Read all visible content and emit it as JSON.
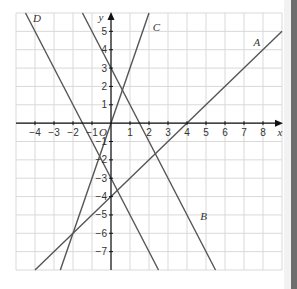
{
  "chart_data": {
    "type": "line",
    "title": "",
    "xlabel": "x",
    "ylabel": "y",
    "origin_label": "O",
    "xlim": [
      -5,
      9
    ],
    "ylim": [
      -8,
      6
    ],
    "grid": true,
    "x_ticks": [
      -4,
      -3,
      -2,
      -1,
      1,
      2,
      3,
      4,
      5,
      6,
      7,
      8
    ],
    "y_ticks": [
      -7,
      -6,
      -5,
      -4,
      -3,
      -2,
      -1,
      1,
      2,
      3,
      4,
      5
    ],
    "x_tick_labels": [
      "−4",
      "−3",
      "−2",
      "−1",
      "1",
      "2",
      "3",
      "4",
      "5",
      "6",
      "7",
      "8"
    ],
    "y_tick_labels": [
      "−7",
      "−6",
      "−5",
      "−4",
      "−3",
      "−2",
      "−1",
      "1",
      "2",
      "3",
      "4",
      "5"
    ],
    "series": [
      {
        "name": "A",
        "slope": 1,
        "intercept": -4,
        "label_at": [
          7.5,
          4.2
        ]
      },
      {
        "name": "B",
        "slope": -2,
        "intercept": 3,
        "label_at": [
          4.7,
          -5.3
        ]
      },
      {
        "name": "C",
        "slope": 3,
        "intercept": 0,
        "label_at": [
          2.2,
          5.0
        ]
      },
      {
        "name": "D",
        "slope": -2,
        "intercept": -3,
        "label_at": [
          -4.1,
          5.5
        ]
      }
    ],
    "colors": {
      "grid": "#d9d9d9",
      "axis": "#111111",
      "line": "#555555"
    }
  }
}
